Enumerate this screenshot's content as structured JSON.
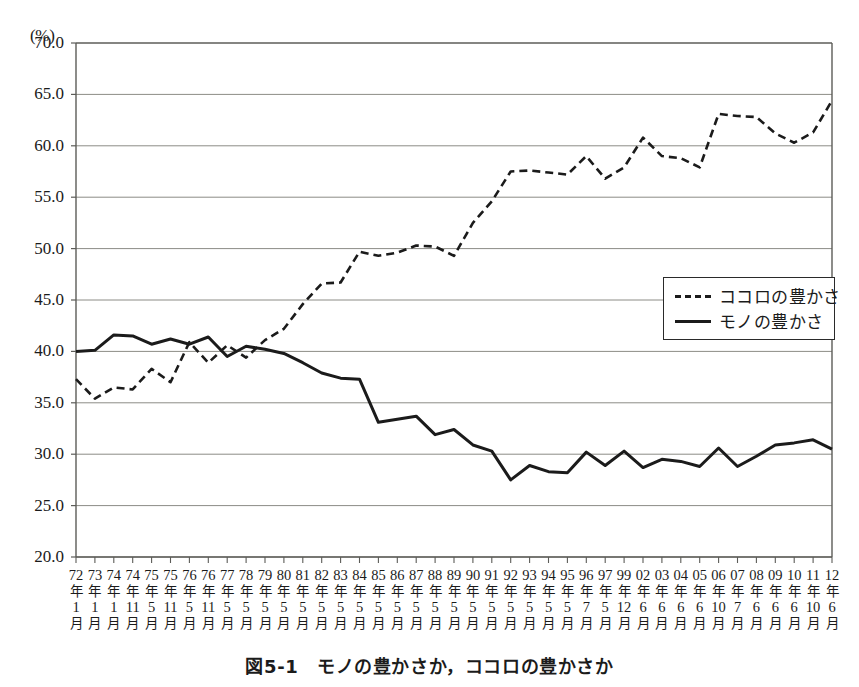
{
  "caption": "図5-1　モノの豊かさか，ココロの豊かさか",
  "axis": {
    "unit_label": "(%)",
    "y_ticks": [
      "70.0",
      "65.0",
      "60.0",
      "55.0",
      "50.0",
      "45.0",
      "40.0",
      "35.0",
      "30.0",
      "25.0",
      "20.0"
    ],
    "year_suffix": "年",
    "month_suffix": "月"
  },
  "legend": {
    "position": "inside-right",
    "entries": [
      {
        "label": "ココロの豊かさ",
        "style": "dashed"
      },
      {
        "label": "モノの豊かさ",
        "style": "solid"
      }
    ]
  },
  "colors": {
    "line": "#1b1b1b",
    "grid": "#8c8c86",
    "frame": "#5c5c58",
    "background": "#ffffff"
  },
  "chart_data": {
    "type": "line",
    "title": "図5-1　モノの豊かさか，ココロの豊かさか",
    "xlabel": "",
    "ylabel": "(%)",
    "ylim": [
      20.0,
      70.0
    ],
    "ytick_step": 5.0,
    "grid": true,
    "categories": [
      "72年1月",
      "73年1月",
      "74年1月",
      "74年11月",
      "75年5月",
      "75年11月",
      "76年5月",
      "76年11月",
      "77年5月",
      "78年5月",
      "79年5月",
      "80年5月",
      "81年5月",
      "82年5月",
      "83年5月",
      "84年5月",
      "85年5月",
      "86年5月",
      "87年5月",
      "88年5月",
      "89年5月",
      "90年5月",
      "91年5月",
      "92年5月",
      "93年5月",
      "94年5月",
      "95年5月",
      "96年7月",
      "97年5月",
      "99年12月",
      "02年6月",
      "03年6月",
      "04年6月",
      "05年6月",
      "06年10月",
      "07年7月",
      "08年6月",
      "09年6月",
      "10年6月",
      "11年10月",
      "12年6月"
    ],
    "year_labels": [
      "72",
      "73",
      "74",
      "74",
      "75",
      "75",
      "76",
      "76",
      "77",
      "78",
      "79",
      "80",
      "81",
      "82",
      "83",
      "84",
      "85",
      "86",
      "87",
      "88",
      "89",
      "90",
      "91",
      "92",
      "93",
      "94",
      "95",
      "96",
      "97",
      "99",
      "02",
      "03",
      "04",
      "05",
      "06",
      "07",
      "08",
      "09",
      "10",
      "11",
      "12"
    ],
    "month_labels": [
      "1",
      "1",
      "1",
      "11",
      "5",
      "11",
      "5",
      "11",
      "5",
      "5",
      "5",
      "5",
      "5",
      "5",
      "5",
      "5",
      "5",
      "5",
      "5",
      "5",
      "5",
      "5",
      "5",
      "5",
      "5",
      "5",
      "5",
      "7",
      "5",
      "12",
      "6",
      "6",
      "6",
      "6",
      "10",
      "7",
      "6",
      "6",
      "6",
      "10",
      "6"
    ],
    "series": [
      {
        "name": "ココロの豊かさ",
        "style": "dashed",
        "values": [
          37.3,
          35.4,
          36.5,
          36.3,
          38.3,
          37.0,
          40.9,
          38.9,
          40.6,
          39.4,
          41.1,
          42.2,
          44.6,
          46.6,
          46.7,
          49.7,
          49.3,
          49.6,
          50.3,
          50.2,
          49.3,
          52.5,
          54.6,
          57.5,
          57.6,
          57.4,
          57.2,
          59.0,
          56.8,
          57.9,
          60.8,
          59.0,
          58.8,
          57.9,
          63.1,
          62.9,
          62.8,
          61.2,
          60.3,
          61.3,
          64.4
        ]
      },
      {
        "name": "モノの豊かさ",
        "style": "solid",
        "values": [
          40.0,
          40.1,
          41.6,
          41.5,
          40.7,
          41.2,
          40.7,
          41.4,
          39.5,
          40.5,
          40.2,
          39.8,
          38.9,
          37.9,
          37.4,
          37.3,
          33.1,
          33.4,
          33.7,
          31.9,
          32.4,
          30.9,
          30.3,
          27.5,
          28.9,
          28.3,
          28.2,
          30.2,
          28.9,
          30.3,
          28.7,
          29.5,
          29.3,
          28.8,
          30.6,
          28.8,
          29.8,
          30.9,
          31.1,
          31.4,
          30.5
        ]
      }
    ]
  }
}
